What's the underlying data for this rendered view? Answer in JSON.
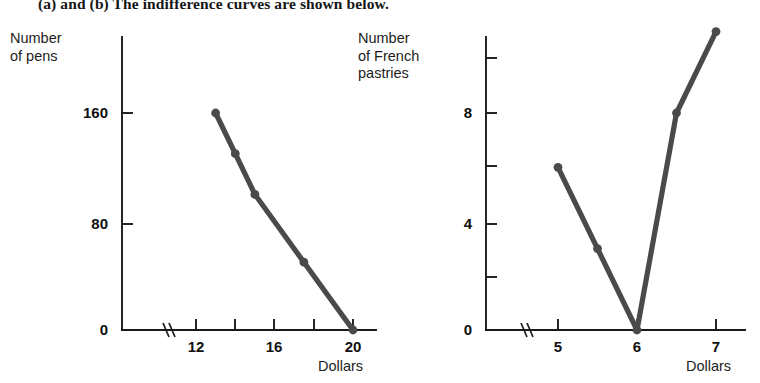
{
  "header": {
    "text": "(a) and (b) The indifference curves are shown below."
  },
  "charts": [
    {
      "id": "pens-chart",
      "ylabel": "Number\nof pens",
      "xlabel": "Dollars",
      "line_color": "#4a4a4a",
      "axis_color": "#1a1a1a",
      "axis_break": true,
      "chart_data": {
        "type": "line",
        "title": "",
        "xlabel": "Dollars",
        "ylabel": "Number of pens",
        "x": [
          13,
          14,
          15,
          17.5,
          20
        ],
        "values": [
          160,
          130,
          100,
          50,
          0
        ],
        "xlim": [
          11,
          21
        ],
        "ylim": [
          0,
          200
        ],
        "xticks": [
          12,
          14,
          16,
          18,
          20
        ],
        "xtick_labels": [
          "12",
          "",
          "16",
          "",
          "20"
        ],
        "yticks": [
          0,
          80,
          160
        ],
        "ytick_labels": [
          "0",
          "80",
          "160"
        ],
        "grid": false,
        "legend": "none",
        "markers": true
      }
    },
    {
      "id": "pastries-chart",
      "ylabel": "Number\nof French\npastries",
      "xlabel": "Dollars",
      "line_color": "#4a4a4a",
      "axis_color": "#1a1a1a",
      "axis_break": true,
      "chart_data": {
        "type": "line",
        "title": "",
        "xlabel": "Dollars",
        "ylabel": "Number of French pastries",
        "x": [
          5,
          5.5,
          6,
          6.5,
          7
        ],
        "values": [
          6,
          3,
          0,
          8,
          11
        ],
        "xlim": [
          4.3,
          7.4
        ],
        "ylim": [
          0,
          12
        ],
        "xticks": [
          5,
          6,
          7
        ],
        "xtick_labels": [
          "5",
          "6",
          "7"
        ],
        "yticks": [
          0,
          2,
          4,
          6,
          8,
          10
        ],
        "ytick_labels": [
          "0",
          "",
          "4",
          "",
          "8",
          ""
        ],
        "grid": false,
        "legend": "none",
        "markers": true
      }
    }
  ]
}
